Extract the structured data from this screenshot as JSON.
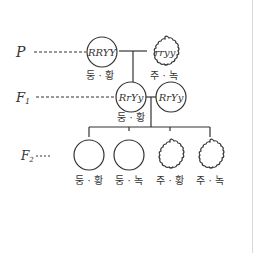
{
  "diagram": {
    "title": "",
    "colors": {
      "stroke": "#333333",
      "text": "#333333",
      "divider": "#d8d8d8",
      "background": "#ffffff"
    },
    "generations": [
      {
        "label": "P",
        "subscript": ""
      },
      {
        "label": "F",
        "subscript": "1"
      },
      {
        "label": "F",
        "subscript": "2"
      }
    ],
    "parents": [
      {
        "genotype": "RRYY",
        "shape": "round",
        "phenotype": "둥 · 황"
      },
      {
        "genotype": "rryy",
        "shape": "wrinkled",
        "phenotype": "주 · 녹"
      }
    ],
    "f1": [
      {
        "genotype": "RrYy",
        "shape": "round",
        "phenotype": "둥 · 황"
      },
      {
        "genotype": "RrYy",
        "shape": "round",
        "phenotype": ""
      }
    ],
    "f2": [
      {
        "shape": "round",
        "phenotype": "둥 · 황"
      },
      {
        "shape": "round",
        "phenotype": "둥 · 녹"
      },
      {
        "shape": "wrinkled",
        "phenotype": "주 · 황"
      },
      {
        "shape": "wrinkled",
        "phenotype": "주 · 녹"
      }
    ]
  }
}
